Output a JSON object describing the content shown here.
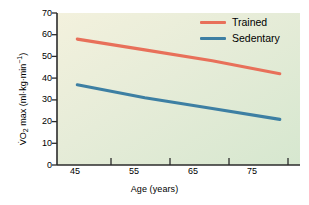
{
  "chart_data": {
    "type": "line",
    "title": "",
    "xlabel": "Age (years)",
    "ylabel": "VO2 max (ml·kg·min⁻¹)",
    "ylabel_parts": {
      "prefix": "V",
      "dot": "̇",
      "o": "O",
      "sub": "2",
      "mid": " max (ml·kg·min",
      "sup": "−1",
      "suffix": ")"
    },
    "x": [
      45,
      55,
      65,
      75
    ],
    "xtick_labels": [
      "45",
      "55",
      "65",
      "75"
    ],
    "ytick_labels": [
      "0",
      "10",
      "20",
      "30",
      "40",
      "50",
      "60",
      "70"
    ],
    "ytick_values": [
      0,
      10,
      20,
      30,
      40,
      50,
      60,
      70
    ],
    "xlim": [
      42,
      78
    ],
    "ylim": [
      0,
      70
    ],
    "grid": false,
    "legend_position": "top-right",
    "series": [
      {
        "name": "Trained",
        "color": "#e8705a",
        "values": [
          58,
          53,
          48,
          42
        ]
      },
      {
        "name": "Sedentary",
        "color": "#3d7fa3",
        "values": [
          37,
          31,
          26,
          21
        ]
      }
    ]
  },
  "figure": {
    "plot_bg_top_left": "#f2f0dc",
    "plot_bg_bottom_right": "#d9e8d2",
    "axis_color": "#2b2b2b",
    "page_bg": "#ffffff"
  }
}
